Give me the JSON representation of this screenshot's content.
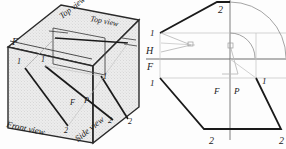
{
  "figure": {
    "type": "technical-drawing",
    "panels": [
      {
        "id": "pictorial-box",
        "name": "glass-box-pictorial",
        "labels": {
          "top_view": "Top view",
          "top_view_2": "Top view",
          "front_view": "Front view",
          "side_view": "Side view",
          "fold_F": "F",
          "plane_F": "F",
          "plane_P": "P",
          "point_1_a": "1",
          "point_1_b": "1",
          "point_1_c": "1",
          "point_2_a": "2",
          "point_2_b": "2",
          "point_2_c": "2"
        }
      },
      {
        "id": "unfolded-projection",
        "name": "unfolded-projection-planes",
        "labels": {
          "plane_H": "H",
          "plane_F_left": "F",
          "plane_F_center": "F",
          "plane_P": "P",
          "point_1_top_left": "1",
          "point_1_mid_left": "1",
          "point_1_right": "1",
          "point_2_top": "2",
          "point_2_bottom_left": "2",
          "point_2_bottom_right": "2"
        }
      }
    ],
    "colors": {
      "ink": "#1a1a1a",
      "light_line": "#9a9a9a",
      "face_fill": "#e8e8e8",
      "background": "#fdfdfd"
    }
  }
}
